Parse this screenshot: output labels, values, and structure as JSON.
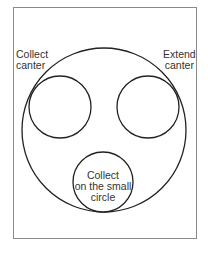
{
  "labels": {
    "left": [
      "Collect",
      "canter"
    ],
    "right": [
      "Extend",
      "canter"
    ],
    "bottom": [
      "Collect",
      "on the small",
      "circle"
    ]
  },
  "colors": {
    "stroke": "#222222",
    "frame": "#8a8a8a",
    "text": "#333333"
  }
}
